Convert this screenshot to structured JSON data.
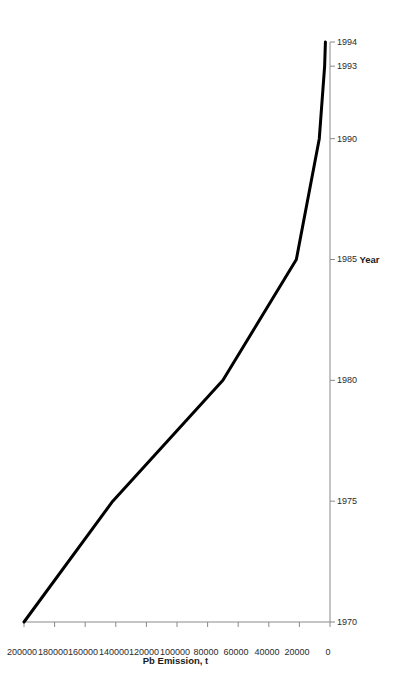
{
  "chart_data": {
    "type": "line",
    "title": "",
    "xlabel": "Year",
    "ylabel": "Pb Emission, t",
    "x": [
      1970,
      1975,
      1980,
      1985,
      1990,
      1993,
      1994
    ],
    "values": [
      200000,
      142000,
      70000,
      22000,
      7000,
      3500,
      3000
    ],
    "series": [
      {
        "name": "Pb Emission",
        "values": [
          200000,
          142000,
          70000,
          22000,
          7000,
          3500,
          3000
        ]
      }
    ],
    "x_tick_labels": [
      "1970",
      "1975",
      "1980",
      "1985",
      "1990",
      "1993",
      "1994"
    ],
    "x_tick_values": [
      1970,
      1975,
      1980,
      1985,
      1990,
      1993,
      1994
    ],
    "y_tick_labels": [
      "0",
      "20000",
      "40000",
      "60000",
      "80000",
      "100000",
      "120000",
      "140000",
      "160000",
      "180000",
      "200000"
    ],
    "y_tick_values": [
      0,
      20000,
      40000,
      60000,
      80000,
      100000,
      120000,
      140000,
      160000,
      180000,
      200000
    ],
    "xlim": [
      1970,
      1994
    ],
    "ylim": [
      0,
      200000
    ],
    "grid": false,
    "legend": false,
    "line_color": "#000000",
    "axis_color": "#808080",
    "orientation": "rotated-90-ccw"
  },
  "axis": {
    "x_title": "Year",
    "y_title": "Pb Emission, t"
  }
}
